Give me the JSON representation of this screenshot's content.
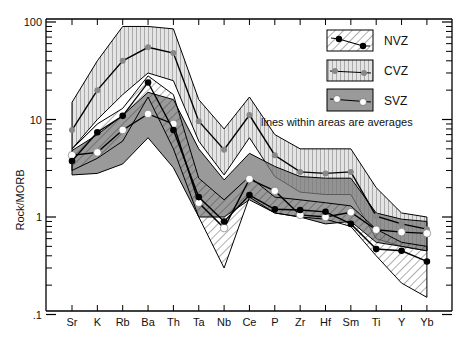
{
  "chart_data": {
    "type": "line",
    "title": "",
    "xlabel": "",
    "ylabel": "Rock/MORB",
    "yscale": "log",
    "ylim": [
      0.1,
      100
    ],
    "yticks": [
      {
        "v": 0.1,
        "label": ".1"
      },
      {
        "v": 1,
        "label": "1"
      },
      {
        "v": 10,
        "label": "10"
      },
      {
        "v": 100,
        "label": "100"
      }
    ],
    "categories": [
      "Sr",
      "K",
      "Rb",
      "Ba",
      "Th",
      "Ta",
      "Nb",
      "Ce",
      "P",
      "Zr",
      "Hf",
      "Sm",
      "Ti",
      "Y",
      "Yb"
    ],
    "grid": false,
    "legend_position": "upper right",
    "annotation": "lines within areas are averages",
    "series": [
      {
        "name": "CVZ",
        "marker": "gray-square-circle",
        "values": [
          7.8,
          20,
          40,
          55,
          48,
          9.6,
          4.9,
          11.1,
          4.3,
          2.9,
          2.8,
          2.9,
          1.02,
          0.85,
          0.75
        ],
        "area_upper": [
          15,
          40,
          90,
          90,
          85,
          16,
          8,
          17,
          7,
          5,
          5,
          5,
          2.0,
          1.1,
          1.0
        ],
        "area_lower": [
          5,
          10,
          18,
          30,
          25,
          6,
          2.7,
          6.5,
          2.6,
          1.8,
          1.7,
          1.7,
          0.6,
          0.5,
          0.45
        ]
      },
      {
        "name": "SVZ",
        "marker": "white-circle",
        "values": [
          4.3,
          4.6,
          7.8,
          11.4,
          9.0,
          1.4,
          0.77,
          2.45,
          1.85,
          1.05,
          1.0,
          1.12,
          0.74,
          0.7,
          0.68
        ],
        "area_upper": [
          4.8,
          7,
          11,
          19,
          16,
          5,
          2.4,
          4.5,
          3.3,
          2.6,
          2.5,
          2.5,
          1.1,
          0.95,
          0.9
        ],
        "area_lower": [
          2.7,
          2.8,
          3.5,
          6.5,
          3.2,
          1.0,
          1.0,
          1.5,
          1.1,
          1.0,
          0.85,
          0.9,
          0.55,
          0.5,
          0.45
        ]
      },
      {
        "name": "NVZ",
        "marker": "black-circle",
        "values": [
          3.75,
          7.4,
          10.9,
          24,
          7.8,
          1.6,
          0.9,
          1.68,
          1.2,
          1.18,
          1.13,
          0.85,
          0.47,
          0.45,
          0.35
        ],
        "area_upper": [
          5,
          9,
          13,
          28,
          18,
          2.5,
          1.5,
          2.6,
          1.6,
          1.5,
          1.4,
          1.3,
          0.75,
          0.55,
          0.5
        ],
        "area_lower": [
          3,
          4,
          6,
          17,
          5,
          1.0,
          0.3,
          1.6,
          1.1,
          1.0,
          0.95,
          0.8,
          0.4,
          0.21,
          0.15
        ]
      }
    ]
  },
  "legend": [
    {
      "name": "NVZ",
      "label": "NVZ"
    },
    {
      "name": "CVZ",
      "label": "CVZ"
    },
    {
      "name": "SVZ",
      "label": "SVZ"
    }
  ],
  "annotation": "lines within areas are averages",
  "ylabel": "Rock/MORB"
}
